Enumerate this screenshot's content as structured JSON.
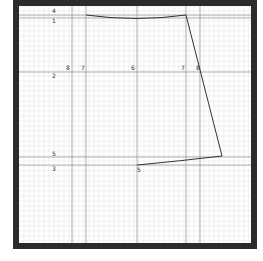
{
  "diagram": {
    "type": "sewing-pattern-draft",
    "frame": {
      "x": 13,
      "y": 0,
      "width": 244,
      "height": 249,
      "thickness": 6,
      "color": "#2b2b2b"
    },
    "grid": {
      "minor_spacing": 5,
      "minor_color": "#e6e6e6",
      "major_color": "#9a9a9a"
    },
    "major_lines": {
      "horizontal_y": [
        15,
        18,
        72,
        157,
        165
      ],
      "vertical_x": [
        72,
        86,
        137,
        186,
        200
      ]
    },
    "labels": [
      {
        "text": "4",
        "x": 52,
        "y": 13
      },
      {
        "text": "1",
        "x": 52,
        "y": 23
      },
      {
        "text": "8",
        "x": 66,
        "y": 70
      },
      {
        "text": "7",
        "x": 81,
        "y": 70
      },
      {
        "text": "6",
        "x": 131,
        "y": 70
      },
      {
        "text": "7",
        "x": 181,
        "y": 70
      },
      {
        "text": "8",
        "x": 196,
        "y": 70
      },
      {
        "text": "2",
        "x": 52,
        "y": 78
      },
      {
        "text": "5",
        "x": 52,
        "y": 156
      },
      {
        "text": "3",
        "x": 52,
        "y": 171
      },
      {
        "text": "5",
        "x": 137,
        "y": 172
      }
    ],
    "outline": {
      "color": "#333333",
      "path": "M86,15 Q136,22 186,15 L222,156 Q180,161 137,165"
    }
  }
}
